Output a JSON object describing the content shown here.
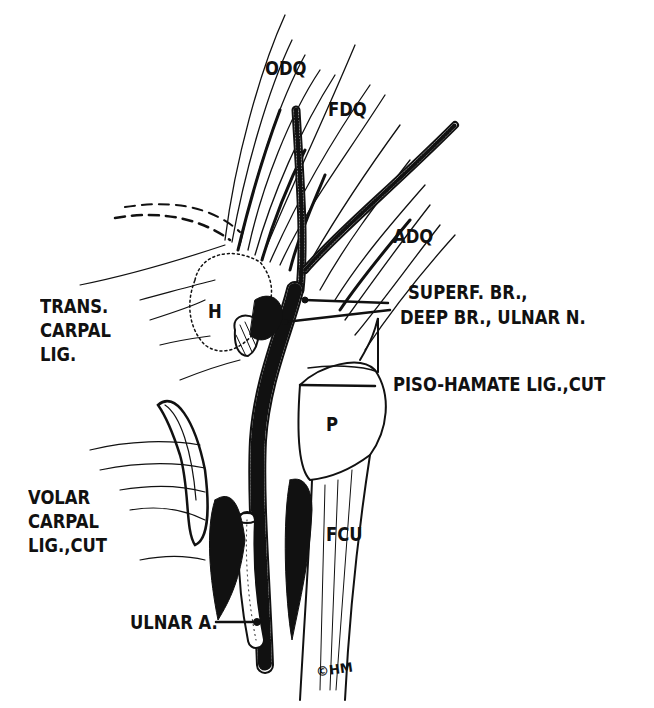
{
  "figure": {
    "type": "anatomical-illustration",
    "style": "black ink line drawing",
    "colors": {
      "ink": "#111111",
      "background": "#ffffff"
    }
  },
  "labels": {
    "odq": "ODQ",
    "fdq": "FDQ",
    "adq": "ADQ",
    "superf_br": "SUPERF. BR.,",
    "deep_br": "DEEP BR., ULNAR N.",
    "piso_hamate": "PISO-HAMATE LIG.,CUT",
    "trans_carpal": [
      "TRANS.",
      "CARPAL",
      "LIG."
    ],
    "hamate": "H",
    "pisiform": "P",
    "volar_carpal": [
      "VOLAR",
      "CARPAL",
      "LIG.,CUT"
    ],
    "fcu": "FCU",
    "ulnar_a": "ULNAR A."
  },
  "signature": "©HM"
}
